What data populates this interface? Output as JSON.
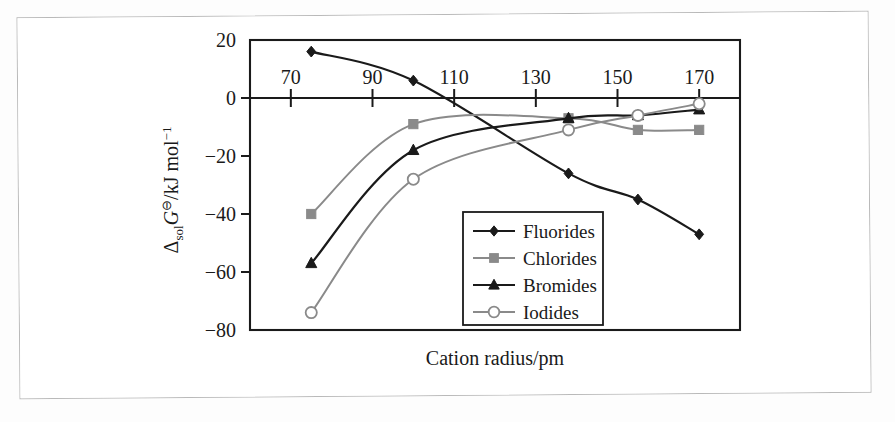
{
  "figure": {
    "x_axis_title": "Cation radius/pm",
    "y_axis_title_parts": {
      "delta": "Δ",
      "sol": "sol",
      "G": "G",
      "standard_state": "⊖",
      "units": "/kJ mol",
      "exponent": "−1"
    },
    "y_axis_title_plain": "ΔsolG⊖/kJ mol−1"
  },
  "legend": {
    "items": [
      {
        "label": "Fluorides",
        "marker": "filled-diamond",
        "color": "#1a1a1a"
      },
      {
        "label": "Chlorides",
        "marker": "filled-square",
        "color": "#8a8a8a"
      },
      {
        "label": "Bromides",
        "marker": "filled-triangle",
        "color": "#1a1a1a"
      },
      {
        "label": "Iodides",
        "marker": "open-circle",
        "color": "#8a8a8a"
      }
    ]
  },
  "axes": {
    "x_tick_labels": [
      "70",
      "90",
      "110",
      "130",
      "150",
      "170"
    ],
    "y_tick_labels": [
      "20",
      "0",
      "−20",
      "−40",
      "−60",
      "−80"
    ]
  },
  "chart_data": {
    "type": "line",
    "title": "",
    "xlabel": "Cation radius/pm",
    "ylabel": "ΔsolG⊖/kJ mol−1",
    "xlim": [
      60,
      180
    ],
    "ylim": [
      -80,
      20
    ],
    "xticks": [
      70,
      90,
      110,
      130,
      150,
      170
    ],
    "yticks": [
      20,
      0,
      -20,
      -40,
      -60,
      -80
    ],
    "grid": false,
    "legend_position": "inside-bottom-center",
    "x": [
      75,
      100,
      138,
      155,
      170
    ],
    "series": [
      {
        "name": "Fluorides",
        "marker": "filled-diamond",
        "color": "#1a1a1a",
        "values": [
          16,
          6,
          -26,
          -35,
          -47
        ]
      },
      {
        "name": "Chlorides",
        "marker": "filled-square",
        "color": "#8a8a8a",
        "values": [
          -40,
          -9,
          -7,
          -11,
          -11
        ]
      },
      {
        "name": "Bromides",
        "marker": "filled-triangle",
        "color": "#1a1a1a",
        "values": [
          -57,
          -18,
          -7,
          -6,
          -4
        ]
      },
      {
        "name": "Iodides",
        "marker": "open-circle",
        "color": "#8a8a8a",
        "values": [
          -74,
          -28,
          -11,
          -6,
          -2
        ]
      }
    ]
  }
}
